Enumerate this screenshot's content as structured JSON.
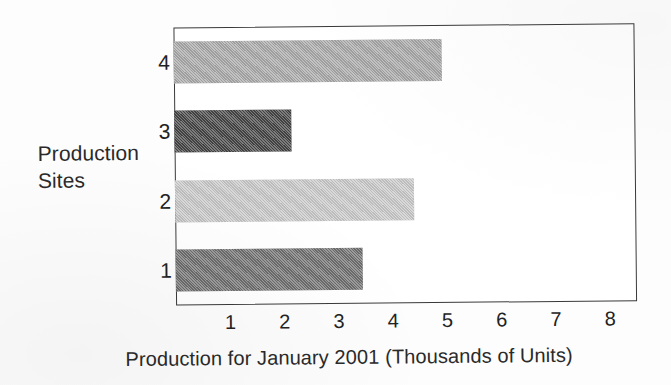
{
  "chart_data": {
    "type": "bar",
    "orientation": "horizontal",
    "title": "",
    "xlabel": "Production for January 2001 (Thousands of Units)",
    "ylabel": "Production Sites",
    "categories": [
      "1",
      "2",
      "3",
      "4"
    ],
    "values": [
      3.45,
      4.4,
      2.15,
      4.95
    ],
    "bar_colors": [
      "#707070",
      "#c8c8c8",
      "#454545",
      "#a8a8a8"
    ],
    "xlim": [
      0,
      8.5
    ],
    "xticks": [
      1,
      2,
      3,
      4,
      5,
      6,
      7,
      8
    ],
    "xtick_labels": [
      "1",
      "2",
      "3",
      "4",
      "5",
      "6",
      "7",
      "8"
    ],
    "ytick_labels": [
      "4",
      "3",
      "2",
      "1"
    ],
    "grid": false,
    "legend": "none",
    "frame": true
  },
  "axes": {
    "y_title_line1": "Production",
    "y_title_line2": "Sites"
  },
  "colors": {
    "frame": "#3a3a3a",
    "text": "#222222",
    "background": "#ffffff"
  }
}
